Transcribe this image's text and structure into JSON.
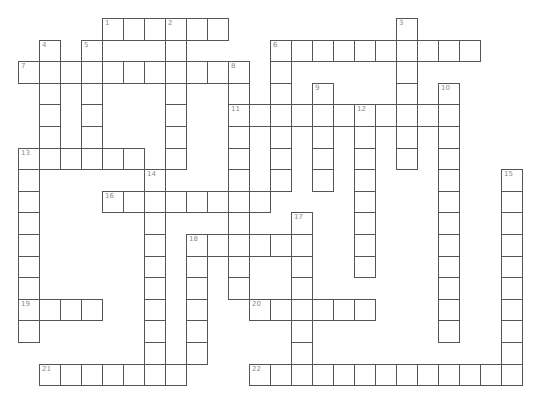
{
  "puzzle": {
    "type": "crossword",
    "grid": {
      "origin_x": 18,
      "origin_y": 18,
      "cell_w": 21,
      "cell_h": 21.6,
      "line_color": "#555555",
      "number_color": "#8a8a8a"
    },
    "words": [
      {
        "number": "1",
        "direction": "across",
        "row": 0,
        "col": 4,
        "length": 6
      },
      {
        "number": "2",
        "direction": "down",
        "row": 0,
        "col": 7,
        "length": 7
      },
      {
        "number": "3",
        "direction": "down",
        "row": 0,
        "col": 18,
        "length": 7
      },
      {
        "number": "4",
        "direction": "down",
        "row": 1,
        "col": 1,
        "length": 6
      },
      {
        "number": "5",
        "direction": "down",
        "row": 1,
        "col": 3,
        "length": 6
      },
      {
        "number": "6",
        "direction": "across",
        "row": 1,
        "col": 12,
        "length": 10
      },
      {
        "number": "6",
        "direction": "down",
        "row": 1,
        "col": 12,
        "length": 7
      },
      {
        "number": "7",
        "direction": "across",
        "row": 2,
        "col": 0,
        "length": 11
      },
      {
        "number": "8",
        "direction": "down",
        "row": 2,
        "col": 10,
        "length": 11
      },
      {
        "number": "9",
        "direction": "down",
        "row": 3,
        "col": 14,
        "length": 5
      },
      {
        "number": "10",
        "direction": "down",
        "row": 3,
        "col": 20,
        "length": 12
      },
      {
        "number": "11",
        "direction": "across",
        "row": 4,
        "col": 10,
        "length": 11
      },
      {
        "number": "12",
        "direction": "down",
        "row": 4,
        "col": 16,
        "length": 8
      },
      {
        "number": "13",
        "direction": "across",
        "row": 6,
        "col": 0,
        "length": 6
      },
      {
        "number": "13",
        "direction": "down",
        "row": 6,
        "col": 0,
        "length": 9
      },
      {
        "number": "14",
        "direction": "down",
        "row": 7,
        "col": 6,
        "length": 10
      },
      {
        "number": "15",
        "direction": "down",
        "row": 7,
        "col": 23,
        "length": 10
      },
      {
        "number": "16",
        "direction": "across",
        "row": 8,
        "col": 4,
        "length": 8
      },
      {
        "number": "17",
        "direction": "down",
        "row": 9,
        "col": 13,
        "length": 8
      },
      {
        "number": "18",
        "direction": "across",
        "row": 10,
        "col": 8,
        "length": 6
      },
      {
        "number": "18",
        "direction": "down",
        "row": 10,
        "col": 8,
        "length": 6
      },
      {
        "number": "19",
        "direction": "across",
        "row": 13,
        "col": 0,
        "length": 4
      },
      {
        "number": "20",
        "direction": "across",
        "row": 13,
        "col": 11,
        "length": 6
      },
      {
        "number": "21",
        "direction": "across",
        "row": 16,
        "col": 1,
        "length": 7
      },
      {
        "number": "22",
        "direction": "across",
        "row": 16,
        "col": 11,
        "length": 13
      }
    ]
  }
}
